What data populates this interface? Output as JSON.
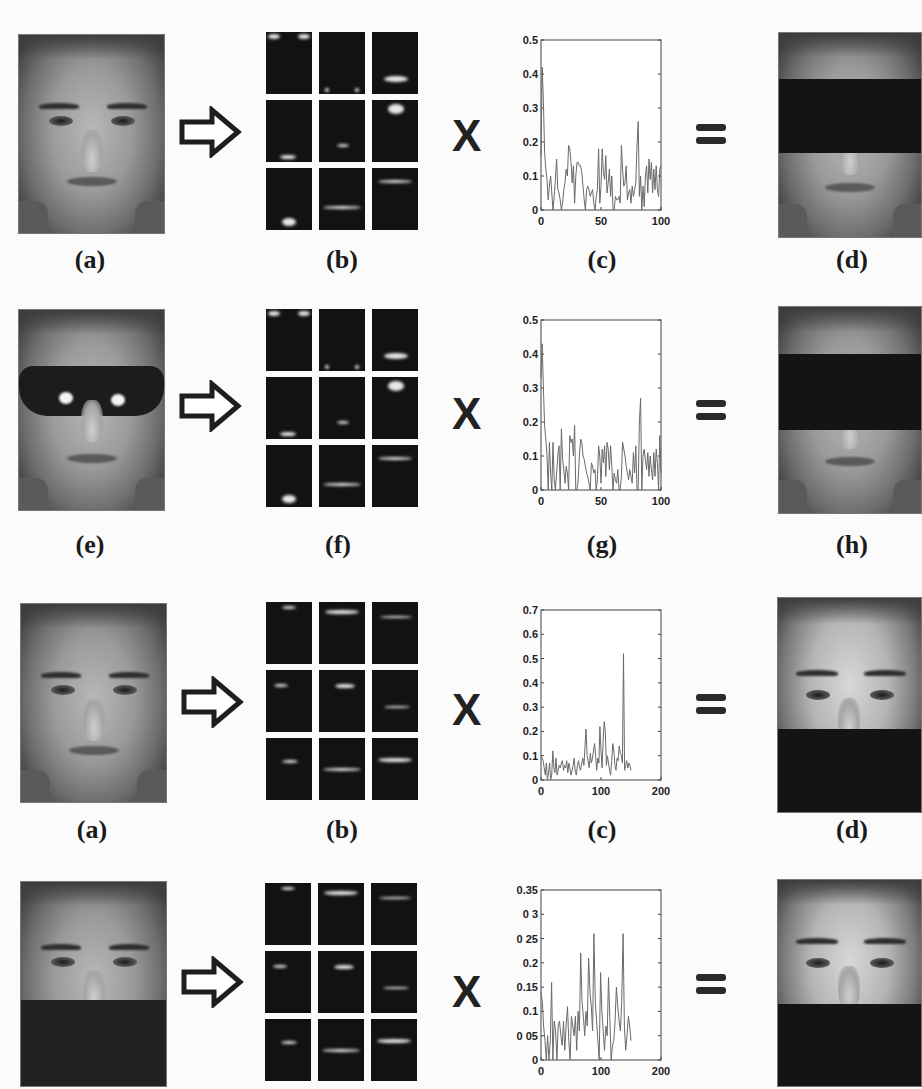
{
  "rows": [
    {
      "id": "row1",
      "input_face": {
        "variant": "clean",
        "caption": "(a)"
      },
      "basis": {
        "caption": "(b)"
      },
      "operator_times": "X",
      "chart": {
        "caption": "(c)"
      },
      "operator_equals": "=",
      "output_face": {
        "variant": "eyes-occluded",
        "caption": "(d)"
      }
    },
    {
      "id": "row2",
      "input_face": {
        "variant": "sunglasses",
        "caption": "(e)"
      },
      "basis": {
        "caption": "(f)"
      },
      "operator_times": "X",
      "chart": {
        "caption": "(g)"
      },
      "operator_equals": "=",
      "output_face": {
        "variant": "eyes-occluded",
        "caption": "(h)"
      }
    },
    {
      "id": "row3",
      "input_face": {
        "variant": "clean",
        "caption": "(a)"
      },
      "basis": {
        "caption": "(b)"
      },
      "operator_times": "X",
      "chart": {
        "caption": "(c)"
      },
      "operator_equals": "=",
      "output_face": {
        "variant": "lower-occluded",
        "caption": "(d)"
      }
    },
    {
      "id": "row4",
      "input_face": {
        "variant": "scarf",
        "caption": ""
      },
      "basis": {
        "caption": ""
      },
      "operator_times": "X",
      "chart": {
        "caption": ""
      },
      "operator_equals": "=",
      "output_face": {
        "variant": "lower-occluded",
        "caption": ""
      }
    }
  ],
  "chart_data": [
    {
      "type": "line",
      "title": "(c)",
      "xlabel": "",
      "ylabel": "",
      "xlim": [
        0,
        100
      ],
      "ylim": [
        0,
        0.5
      ],
      "xticks": [
        0,
        50,
        100
      ],
      "yticks": [
        0,
        0.1,
        0.2,
        0.3,
        0.4,
        0.5
      ],
      "ytick_labels": [
        "0",
        "0.1",
        "0.2",
        "0.3",
        "0.4",
        "0.5"
      ],
      "grid": false,
      "x": [
        0,
        1,
        2,
        3,
        4,
        5,
        6,
        7,
        8,
        9,
        10,
        11,
        12,
        13,
        14,
        15,
        16,
        17,
        18,
        19,
        20,
        21,
        22,
        23,
        24,
        25,
        26,
        27,
        28,
        29,
        30,
        31,
        32,
        33,
        34,
        35,
        36,
        37,
        38,
        39,
        40,
        41,
        42,
        43,
        44,
        45,
        46,
        47,
        48,
        49,
        50,
        51,
        52,
        53,
        54,
        55,
        56,
        57,
        58,
        59,
        60,
        61,
        62,
        63,
        64,
        65,
        66,
        67,
        68,
        69,
        70,
        71,
        72,
        73,
        74,
        75,
        76,
        77,
        78,
        79,
        80,
        81,
        82,
        83,
        84,
        85,
        86,
        87,
        88,
        89,
        90,
        91,
        92,
        93,
        94,
        95,
        96,
        97,
        98,
        99,
        100
      ],
      "values": [
        0.16,
        0.42,
        0.32,
        0.17,
        0.12,
        0.09,
        0.03,
        0.07,
        0.1,
        0.05,
        0.0,
        0.04,
        0.09,
        0.15,
        0.06,
        0.05,
        0.03,
        0.0,
        0.02,
        0.06,
        0.08,
        0.12,
        0.1,
        0.19,
        0.18,
        0.14,
        0.08,
        0.13,
        0.02,
        0.1,
        0.14,
        0.14,
        0.13,
        0.13,
        0.11,
        0.07,
        0.03,
        0.0,
        0.06,
        0.07,
        0.06,
        0.04,
        0.05,
        0.06,
        0.02,
        0.0,
        0.04,
        0.06,
        0.18,
        0.02,
        0.07,
        0.18,
        0.11,
        0.09,
        0.16,
        0.05,
        0.08,
        0.12,
        0.04,
        0.1,
        0.0,
        0.0,
        0.04,
        0.03,
        0.03,
        0.04,
        0.02,
        0.19,
        0.12,
        0.07,
        0.08,
        0.13,
        0.03,
        0.05,
        0.06,
        0.02,
        0.07,
        0.04,
        0.06,
        0.08,
        0.19,
        0.26,
        0.04,
        0.1,
        0.0,
        0.07,
        0.01,
        0.1,
        0.13,
        0.05,
        0.15,
        0.09,
        0.14,
        0.05,
        0.12,
        0.06,
        0.13,
        0.06,
        0.04,
        0.12,
        0.13
      ]
    },
    {
      "type": "line",
      "title": "(g)",
      "xlabel": "",
      "ylabel": "",
      "xlim": [
        0,
        100
      ],
      "ylim": [
        0,
        0.5
      ],
      "xticks": [
        0,
        50,
        100
      ],
      "yticks": [
        0,
        0.1,
        0.2,
        0.3,
        0.4,
        0.5
      ],
      "ytick_labels": [
        "0",
        "0.1",
        "0.2",
        "0.3",
        "0.4",
        "0.5"
      ],
      "grid": false,
      "x": [
        0,
        1,
        2,
        3,
        4,
        5,
        6,
        7,
        8,
        9,
        10,
        11,
        12,
        13,
        14,
        15,
        16,
        17,
        18,
        19,
        20,
        21,
        22,
        23,
        24,
        25,
        26,
        27,
        28,
        29,
        30,
        31,
        32,
        33,
        34,
        35,
        36,
        37,
        38,
        39,
        40,
        41,
        42,
        43,
        44,
        45,
        46,
        47,
        48,
        49,
        50,
        51,
        52,
        53,
        54,
        55,
        56,
        57,
        58,
        59,
        60,
        61,
        62,
        63,
        64,
        65,
        66,
        67,
        68,
        69,
        70,
        71,
        72,
        73,
        74,
        75,
        76,
        77,
        78,
        79,
        80,
        81,
        82,
        83,
        84,
        85,
        86,
        87,
        88,
        89,
        90,
        91,
        92,
        93,
        94,
        95,
        96,
        97,
        98,
        99,
        100
      ],
      "values": [
        0.33,
        0.43,
        0.3,
        0.19,
        0.15,
        0.1,
        0.0,
        0.14,
        0.05,
        0.0,
        0.14,
        0.03,
        0.0,
        0.05,
        0.1,
        0.13,
        0.0,
        0.18,
        0.09,
        0.06,
        0.02,
        0.07,
        0.05,
        0.0,
        0.16,
        0.14,
        0.15,
        0.1,
        0.19,
        0.0,
        0.0,
        0.03,
        0.1,
        0.15,
        0.14,
        0.1,
        0.09,
        0.07,
        0.05,
        0.04,
        0.02,
        0.0,
        0.08,
        0.07,
        0.05,
        0.06,
        0.0,
        0.03,
        0.13,
        0.1,
        0.02,
        0.12,
        0.08,
        0.13,
        0.04,
        0.14,
        0.12,
        0.06,
        0.13,
        0.07,
        0.0,
        0.05,
        0.03,
        0.02,
        0.06,
        0.0,
        0.0,
        0.04,
        0.14,
        0.12,
        0.1,
        0.07,
        0.05,
        0.03,
        0.06,
        0.04,
        0.02,
        0.11,
        0.05,
        0.13,
        0.0,
        0.0,
        0.2,
        0.27,
        0.0,
        0.1,
        0.12,
        0.09,
        0.06,
        0.11,
        0.04,
        0.1,
        0.06,
        0.03,
        0.11,
        0.04,
        0.12,
        0.08,
        0.0,
        0.16,
        0.05
      ]
    },
    {
      "type": "line",
      "title": "(c)",
      "xlabel": "",
      "ylabel": "",
      "xlim": [
        0,
        200
      ],
      "ylim": [
        0,
        0.7
      ],
      "xticks": [
        0,
        100,
        200
      ],
      "yticks": [
        0,
        0.1,
        0.2,
        0.3,
        0.4,
        0.5,
        0.6,
        0.7
      ],
      "ytick_labels": [
        "0",
        "0.1",
        "0.2",
        "0.3",
        "0.4",
        "0.5",
        "0.6",
        "0.7"
      ],
      "grid": false,
      "x_range_of_data": [
        0,
        150
      ],
      "values": [
        0.1,
        0.09,
        0.08,
        0.05,
        0.02,
        0.07,
        0.0,
        0.03,
        0.07,
        0.0,
        0.02,
        0.12,
        0.05,
        0.03,
        0.09,
        0.02,
        0.04,
        0.06,
        0.05,
        0.07,
        0.08,
        0.04,
        0.06,
        0.05,
        0.08,
        0.03,
        0.07,
        0.05,
        0.02,
        0.04,
        0.06,
        0.09,
        0.03,
        0.02,
        0.06,
        0.08,
        0.05,
        0.04,
        0.07,
        0.09,
        0.06,
        0.13,
        0.21,
        0.1,
        0.08,
        0.05,
        0.11,
        0.07,
        0.09,
        0.12,
        0.15,
        0.1,
        0.04,
        0.09,
        0.07,
        0.22,
        0.12,
        0.05,
        0.16,
        0.24,
        0.2,
        0.06,
        0.1,
        0.07,
        0.04,
        0.02,
        0.08,
        0.15,
        0.12,
        0.06,
        0.04,
        0.09,
        0.08,
        0.14,
        0.11,
        0.1,
        0.07,
        0.52,
        0.04,
        0.06,
        0.08,
        0.05,
        0.07,
        0.06,
        0.04
      ]
    },
    {
      "type": "line",
      "title": "",
      "xlabel": "",
      "ylabel": "",
      "xlim": [
        0,
        200
      ],
      "ylim": [
        0,
        0.35
      ],
      "xticks": [
        0,
        100,
        200
      ],
      "yticks": [
        0,
        0.05,
        0.1,
        0.15,
        0.2,
        0.25,
        0.3,
        0.35
      ],
      "ytick_labels": [
        "0",
        "0 05",
        "0.1",
        "0.15",
        "0.2",
        "0 25",
        "0 3",
        "0.35"
      ],
      "grid": false,
      "x_range_of_data": [
        0,
        150
      ],
      "values": [
        0.14,
        0.12,
        0.07,
        0.04,
        0.0,
        0.05,
        0.0,
        0.04,
        0.16,
        0.0,
        0.08,
        0.06,
        0.0,
        0.07,
        0.08,
        0.05,
        0.03,
        0.08,
        0.02,
        0.07,
        0.11,
        0.04,
        0.0,
        0.09,
        0.07,
        0.05,
        0.09,
        0.02,
        0.1,
        0.06,
        0.22,
        0.12,
        0.09,
        0.05,
        0.1,
        0.07,
        0.21,
        0.14,
        0.11,
        0.06,
        0.26,
        0.12,
        0.08,
        0.04,
        0.0,
        0.18,
        0.1,
        0.06,
        0.02,
        0.07,
        0.05,
        0.17,
        0.09,
        0.0,
        0.03,
        0.04,
        0.08,
        0.15,
        0.11,
        0.08,
        0.06,
        0.12,
        0.26,
        0.07,
        0.02,
        0.05,
        0.09,
        0.07,
        0.04
      ]
    }
  ],
  "colors": {
    "background": "#fbfbfb",
    "plot_line": "#6a6a6a",
    "axis": "#444444",
    "basis_bg": "#121212",
    "occlusion": "#141414"
  }
}
